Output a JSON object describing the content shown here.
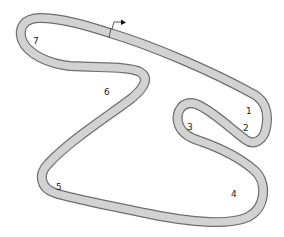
{
  "diagram": {
    "type": "race-circuit-map",
    "colors": {
      "track_fill": "#d2d2d2",
      "track_edge": "#6e6e6e",
      "label": "#1a1a1a",
      "background": "#ffffff"
    },
    "start_finish": {
      "icon": "start-flag-arrow-icon",
      "direction": "right"
    },
    "turns": [
      {
        "number": "1",
        "label": "1"
      },
      {
        "number": "2",
        "label": "2"
      },
      {
        "number": "3",
        "label": "3"
      },
      {
        "number": "4",
        "label": "4"
      },
      {
        "number": "5",
        "label": "5"
      },
      {
        "number": "6",
        "label": "6"
      },
      {
        "number": "7",
        "label": "7"
      }
    ]
  }
}
